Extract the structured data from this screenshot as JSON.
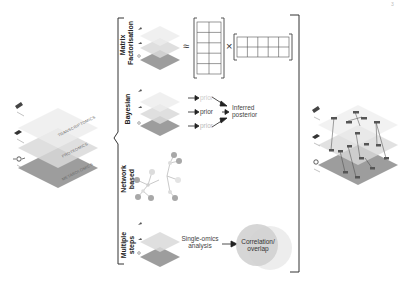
{
  "figure": {
    "page_marker": "3",
    "left_stack": {
      "layers": [
        {
          "label": "TRANSCRIPTOMICS",
          "color": "#ececec"
        },
        {
          "label": "PROTEOMICS",
          "color": "#d9d9d9"
        },
        {
          "label": "METABOLOMICS",
          "color": "#9d9d9d"
        }
      ]
    },
    "methods": [
      {
        "name_line1": "Matrix",
        "name_line2": "Factorisation",
        "approx_symbol": "≈",
        "times_symbol": "×"
      },
      {
        "name_line1": "Bayesian",
        "priors": [
          "prior",
          "prior",
          "prior"
        ],
        "result_line1": "Inferred",
        "result_line2": "posterior"
      },
      {
        "name_line1": "Network",
        "name_line2": "based"
      },
      {
        "name_line1": "Multiple",
        "name_line2": "steps",
        "step_label_line1": "Single-omics",
        "step_label_line2": "analysis",
        "result_line1": "Correlation/",
        "result_line2": "overlap"
      }
    ],
    "colors": {
      "layer_light": "#ececec",
      "layer_mid": "#d9d9d9",
      "layer_dark": "#9d9d9d",
      "bracket": "#333333",
      "node": "#a8a8a8",
      "circle": "#cfcfcf"
    }
  }
}
